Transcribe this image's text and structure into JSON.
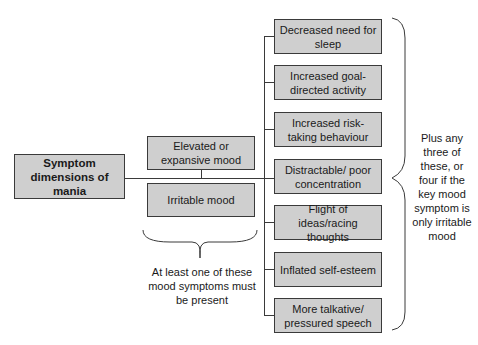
{
  "diagram": {
    "root": {
      "label": "Symptom dimensions of mania"
    },
    "mood_symptoms": [
      {
        "label": "Elevated or expansive mood"
      },
      {
        "label": "Irritable mood"
      }
    ],
    "mood_note": "At least one of these mood symptoms must be present",
    "other_symptoms": [
      {
        "label": "Decreased need for sleep"
      },
      {
        "label": "Increased goal-directed activity"
      },
      {
        "label": "Increased risk-taking behaviour"
      },
      {
        "label": "Distractable/ poor concentration"
      },
      {
        "label": "Flight of ideas/racing thoughts"
      },
      {
        "label": "Inflated self-esteem"
      },
      {
        "label": "More talkative/ pressured speech"
      }
    ],
    "other_note": "Plus any three of these, or four if the key mood symptom is only irritable mood",
    "colors": {
      "box_fill": "#cfcfcf",
      "line": "#3a3a3a"
    }
  }
}
